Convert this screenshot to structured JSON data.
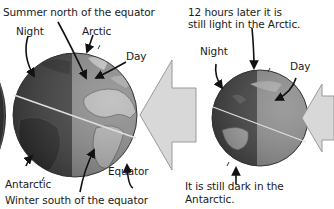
{
  "diagram": {
    "left_scene": {
      "title_top": "Summer north of the equator",
      "title_bottom": "Winter south of the equator",
      "labels": {
        "night": "Night",
        "day": "Day",
        "arctic": "Arctic",
        "antarctic": "Antarctic",
        "equator": "Equator"
      }
    },
    "right_scene": {
      "caption_top_line1": "12 hours later it is",
      "caption_top_line2": "still light in the Arctic.",
      "caption_bottom_line1": "It is still dark in the",
      "caption_bottom_line2": "Antarctic.",
      "labels": {
        "night": "Night",
        "day": "Day"
      }
    },
    "icons": {
      "sunlight_arrow_large": "sunlight-arrow-left",
      "sunlight_arrow_small": "sunlight-arrow-left",
      "globe_large": "earth-globe",
      "globe_small": "earth-globe"
    },
    "colors": {
      "night_side": "#3a3a3a",
      "day_side": "#8a8a8a",
      "land_day": "#b8b8b8",
      "land_night": "#262626",
      "arrow_fill": "#d8d8d8",
      "arrow_stroke": "#9a9a9a",
      "equator_line": "#e0e0e0",
      "text": "#1a1a1a"
    }
  }
}
